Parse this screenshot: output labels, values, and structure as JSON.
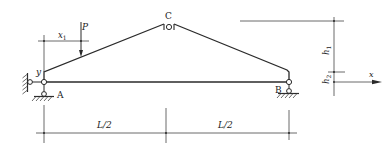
{
  "figure": {
    "type": "three-hinged truss arch",
    "labels": {
      "node_a": "A",
      "node_b": "B",
      "node_c": "C",
      "load": "P",
      "load_position": "x",
      "load_position_sub": "1",
      "y_axis": "y",
      "x_axis": "x",
      "height_top": "h",
      "height_top_sub": "1",
      "height_bottom": "h",
      "height_bottom_sub": "2",
      "span_left": "L/2",
      "span_right": "L/2"
    },
    "colors": {
      "line": "#2a2a2a",
      "background": "#ffffff"
    }
  }
}
